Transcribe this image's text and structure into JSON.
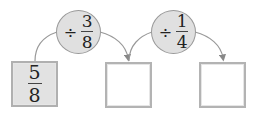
{
  "diagram": {
    "start": {
      "numerator": "5",
      "denominator": "8"
    },
    "operations": [
      {
        "sign": "÷",
        "numerator": "3",
        "denominator": "8"
      },
      {
        "sign": "÷",
        "numerator": "1",
        "denominator": "4"
      }
    ],
    "answer_boxes": [
      "",
      ""
    ],
    "colors": {
      "box_border": "#b3b3b3",
      "filled_box": "#e2e2e2",
      "operation_circle": "#e0e0e0",
      "arrow": "#888888"
    }
  }
}
